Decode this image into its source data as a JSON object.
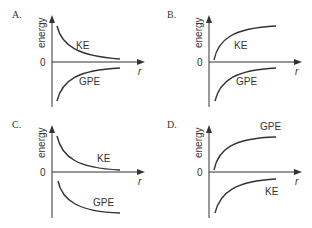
{
  "axis": {
    "y_label": "energy",
    "x_label": "r",
    "origin_label": "0"
  },
  "panels": [
    {
      "id": "A",
      "label": "A.",
      "upper_curve": {
        "name": "KE",
        "shape": "decreasing-to-zero-from-above"
      },
      "lower_curve": {
        "name": "GPE",
        "shape": "increasing-to-zero-from-below"
      }
    },
    {
      "id": "B",
      "label": "B.",
      "upper_curve": {
        "name": "KE",
        "shape": "increasing-rising-from-zero-to-plateau"
      },
      "lower_curve": {
        "name": "GPE",
        "shape": "increasing-to-zero-from-below"
      }
    },
    {
      "id": "C",
      "label": "C.",
      "upper_curve": {
        "name": "KE",
        "shape": "decreasing-to-zero-from-above"
      },
      "lower_curve": {
        "name": "GPE",
        "shape": "decreasing-to-negative-plateau"
      }
    },
    {
      "id": "D",
      "label": "D.",
      "upper_curve": {
        "name": "GPE",
        "shape": "increasing-rising-from-zero-to-plateau"
      },
      "lower_curve": {
        "name": "KE",
        "shape": "increasing-to-zero-from-below"
      }
    }
  ]
}
